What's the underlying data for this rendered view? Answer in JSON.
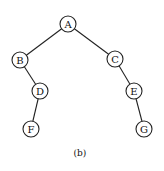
{
  "diagram": {
    "type": "binary-tree",
    "caption": "(b)",
    "nodes": [
      {
        "id": "A",
        "label": "A",
        "x": 68,
        "y": 24
      },
      {
        "id": "B",
        "label": "B",
        "x": 20,
        "y": 60
      },
      {
        "id": "C",
        "label": "C",
        "x": 115,
        "y": 59
      },
      {
        "id": "D",
        "label": "D",
        "x": 40,
        "y": 91
      },
      {
        "id": "E",
        "label": "E",
        "x": 134,
        "y": 91
      },
      {
        "id": "F",
        "label": "F",
        "x": 31,
        "y": 129
      },
      {
        "id": "G",
        "label": "G",
        "x": 144,
        "y": 129
      }
    ],
    "edges": [
      {
        "from": "A",
        "to": "B"
      },
      {
        "from": "A",
        "to": "C"
      },
      {
        "from": "B",
        "to": "D"
      },
      {
        "from": "C",
        "to": "E"
      },
      {
        "from": "D",
        "to": "F"
      },
      {
        "from": "E",
        "to": "G"
      }
    ]
  }
}
